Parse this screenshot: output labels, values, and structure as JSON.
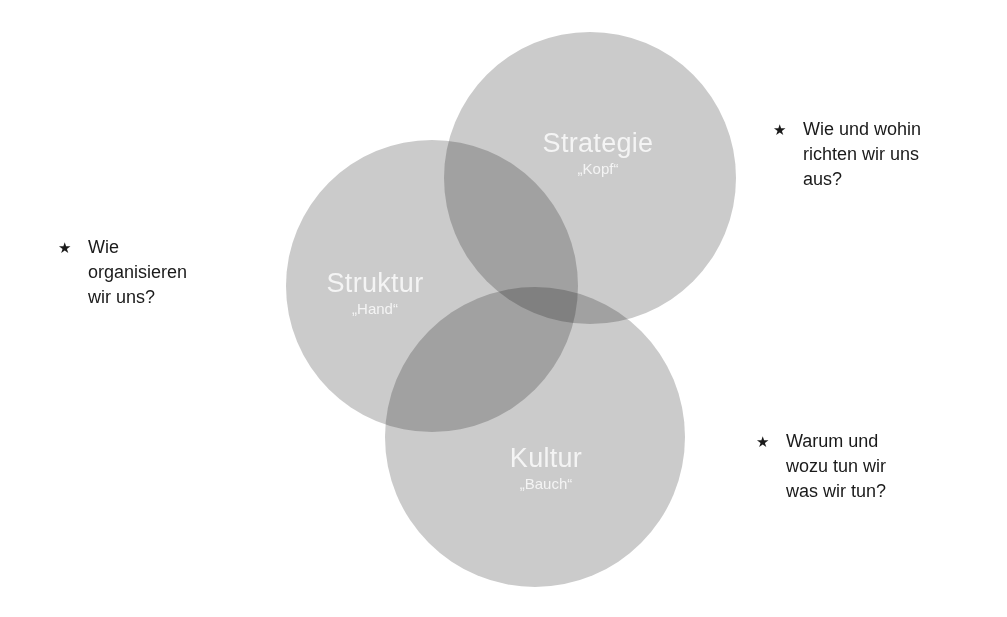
{
  "diagram": {
    "type": "venn",
    "circles": [
      {
        "id": "strategie",
        "title": "Strategie",
        "subtitle": "„Kopf“"
      },
      {
        "id": "struktur",
        "title": "Struktur",
        "subtitle": "„Hand“"
      },
      {
        "id": "kultur",
        "title": "Kultur",
        "subtitle": "„Bauch“"
      }
    ],
    "questions": [
      {
        "target": "struktur",
        "icon": "star-icon",
        "bullet": "★",
        "text": "Wie\norganisieren\nwir uns?"
      },
      {
        "target": "strategie",
        "icon": "star-icon",
        "bullet": "★",
        "text": "Wie und  wohin\nrichten  wir uns\naus?"
      },
      {
        "target": "kultur",
        "icon": "star-icon",
        "bullet": "★",
        "text": "Warum und\nwozu tun wir\nwas wir tun?"
      }
    ],
    "colors": {
      "circle_fill": "#cbcbcb",
      "label_text": "#f4f4f4",
      "question_text": "#1a1a1a",
      "background": "#ffffff"
    }
  }
}
